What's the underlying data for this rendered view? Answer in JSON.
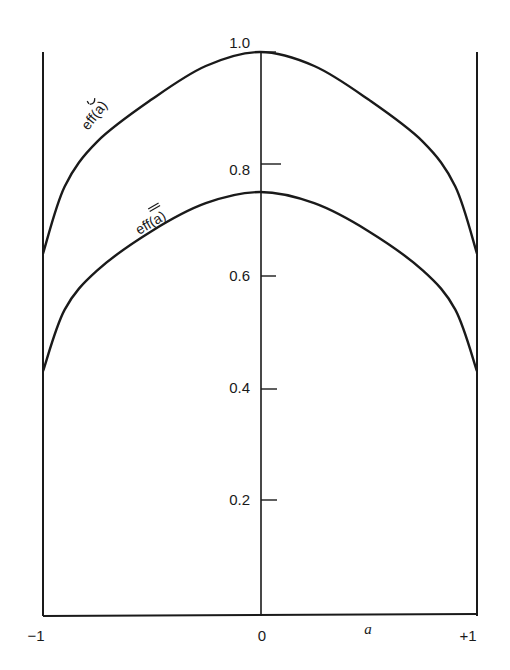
{
  "chart_data": {
    "type": "line",
    "title": "",
    "xlabel": "a",
    "ylabel": "",
    "xlim": [
      -1,
      1
    ],
    "ylim": [
      0,
      1.0
    ],
    "grid": false,
    "legend": "inline labels on curves",
    "x_tick_labels": [
      "−1",
      "0",
      "+1"
    ],
    "y_tick_labels": [
      "0.2",
      "0.4",
      "0.6",
      "0.8",
      "1.0"
    ],
    "x": [
      -1.0,
      -0.9,
      -0.75,
      -0.5,
      -0.25,
      0.0,
      0.25,
      0.5,
      0.75,
      0.9,
      1.0
    ],
    "series": [
      {
        "name": "eff(a~)",
        "label_text": "eff(a)",
        "label_mark": "tilde",
        "values": [
          0.64,
          0.76,
          0.84,
          0.915,
          0.975,
          1.0,
          0.975,
          0.915,
          0.84,
          0.76,
          0.64
        ]
      },
      {
        "name": "eff(a=)",
        "label_text": "eff(a)",
        "label_mark": "double-bar",
        "values": [
          0.43,
          0.54,
          0.61,
          0.68,
          0.73,
          0.75,
          0.73,
          0.68,
          0.61,
          0.54,
          0.43
        ]
      }
    ]
  },
  "labels": {
    "xvar": "a",
    "x_left": "−1",
    "x_mid": "0",
    "x_right": "+1",
    "y_10": "1.0",
    "y_08": "0.8",
    "y_06": "0.6",
    "y_04": "0.4",
    "y_02": "0.2",
    "curve_upper": "eff(a)",
    "curve_lower": "eff(a)"
  }
}
